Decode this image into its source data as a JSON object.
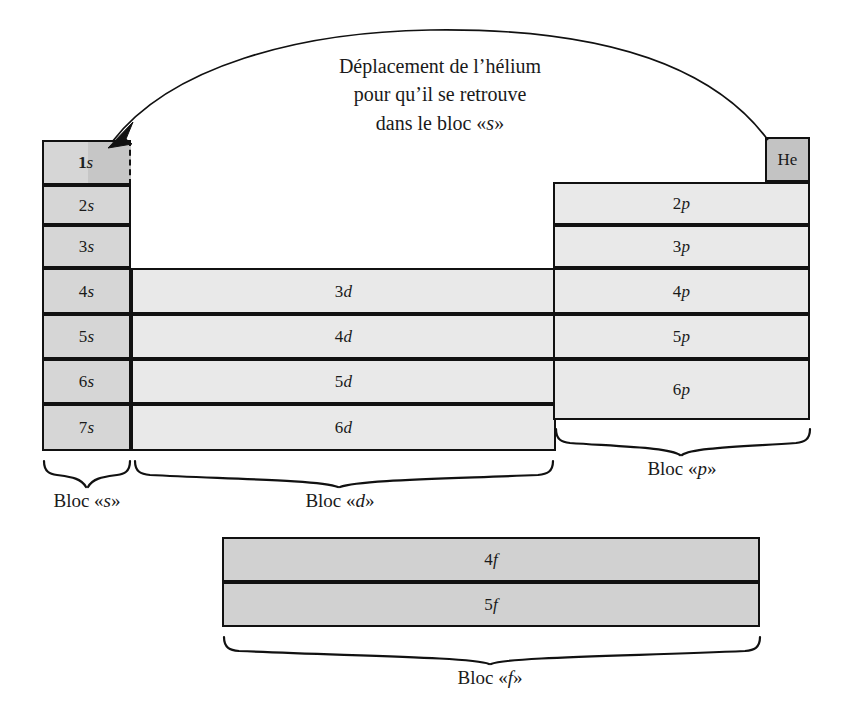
{
  "figure": {
    "type": "periodic-table-block-diagram",
    "language": "fr",
    "background": "#ffffff",
    "stroke": "#111111"
  },
  "annotation": {
    "caption_line1": "Déplacement de l’hélium",
    "caption_line2": "pour qu’il se retrouve",
    "caption_line3": "dans le bloc «sa»",
    "caption_line3_text": "dans le bloc «s»",
    "arrow": "curved-arrow-he-to-1s",
    "arrow_from": "He",
    "arrow_to": "1s"
  },
  "blocks": {
    "s": {
      "label": "Bloc «s»",
      "color": "#d6d6d6",
      "rows": [
        {
          "orbital": "1s",
          "n": "1",
          "letter": "s"
        },
        {
          "orbital": "2s",
          "n": "2",
          "letter": "s"
        },
        {
          "orbital": "3s",
          "n": "3",
          "letter": "s"
        },
        {
          "orbital": "4s",
          "n": "4",
          "letter": "s"
        },
        {
          "orbital": "5s",
          "n": "5",
          "letter": "s"
        },
        {
          "orbital": "6s",
          "n": "6",
          "letter": "s"
        },
        {
          "orbital": "7s",
          "n": "7",
          "letter": "s"
        }
      ]
    },
    "d": {
      "label": "Bloc «d»",
      "color": "#e9e9e9",
      "rows": [
        {
          "orbital": "3d",
          "n": "3",
          "letter": "d"
        },
        {
          "orbital": "4d",
          "n": "4",
          "letter": "d"
        },
        {
          "orbital": "5d",
          "n": "5",
          "letter": "d"
        },
        {
          "orbital": "6d",
          "n": "6",
          "letter": "d"
        }
      ]
    },
    "p": {
      "label": "Bloc «p»",
      "color": "#e9e9e9",
      "rows": [
        {
          "orbital": "2p",
          "n": "2",
          "letter": "p"
        },
        {
          "orbital": "3p",
          "n": "3",
          "letter": "p"
        },
        {
          "orbital": "4p",
          "n": "4",
          "letter": "p"
        },
        {
          "orbital": "5p",
          "n": "5",
          "letter": "p"
        },
        {
          "orbital": "6p",
          "n": "6",
          "letter": "p"
        }
      ]
    },
    "f": {
      "label": "Bloc «f»",
      "color": "#d1d1d1",
      "rows": [
        {
          "orbital": "4f",
          "n": "4",
          "letter": "f"
        },
        {
          "orbital": "5f",
          "n": "5",
          "letter": "f"
        }
      ]
    }
  },
  "helium": {
    "symbol": "He",
    "color": "#c3c3c3",
    "ghost_color": "#c6c6c6",
    "ghost_border": "dashed"
  }
}
